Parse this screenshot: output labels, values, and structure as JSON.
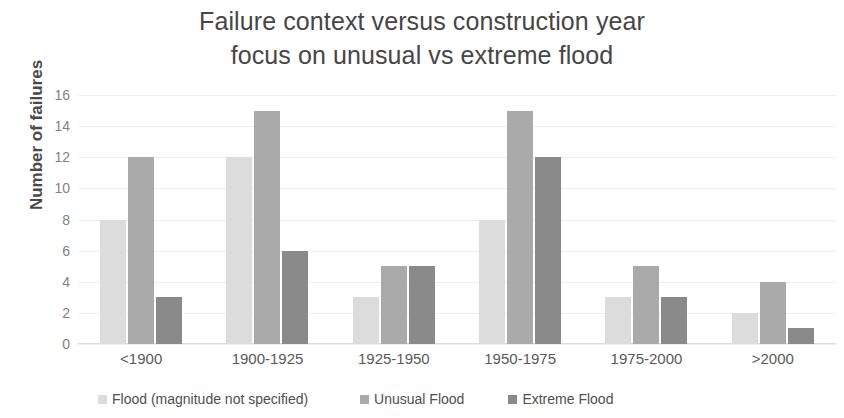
{
  "chart_data": {
    "type": "bar",
    "title": "Failure context versus construction year focus on unusual vs extreme flood",
    "title_lines": [
      "Failure context versus construction year",
      "focus on unusual vs extreme flood"
    ],
    "xlabel": "",
    "ylabel": "Number of failures",
    "ylim": [
      0,
      16
    ],
    "ytick_step": 2,
    "yticks": [
      "16",
      "14",
      "12",
      "10",
      "8",
      "6",
      "4",
      "2",
      "0"
    ],
    "grid": true,
    "legend_position": "bottom",
    "categories": [
      "<1900",
      "1900-1925",
      "1925-1950",
      "1950-1975",
      "1975-2000",
      ">2000"
    ],
    "series": [
      {
        "name": "Flood (magnitude not specified)",
        "color": "#dcdcdc",
        "values": [
          8,
          12,
          3,
          8,
          3,
          2
        ]
      },
      {
        "name": "Unusual Flood",
        "color": "#aaaaaa",
        "values": [
          12,
          15,
          5,
          15,
          5,
          4
        ]
      },
      {
        "name": "Extreme Flood",
        "color": "#8a8a8a",
        "values": [
          3,
          6,
          5,
          12,
          3,
          1
        ]
      }
    ]
  }
}
